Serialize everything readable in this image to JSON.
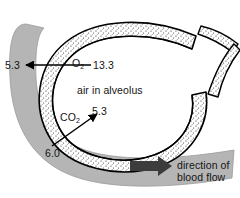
{
  "diagram": {
    "labels": {
      "oxygen": "O",
      "oxygen_sub": "2",
      "carbon_dioxide": "CO",
      "carbon_dioxide_sub": "2",
      "alveolus_space": "air in alveolus",
      "flow_line1": "direction of",
      "flow_line2": "blood flow"
    },
    "values": {
      "o2_in_air": "13.3",
      "o2_in_blood": "5.3",
      "co2_in_air": "5.3",
      "co2_in_blood": "6.0"
    },
    "colors": {
      "blood_vessel": "#b5b5b5",
      "vessel_outline": "#8a8a8a",
      "wall_stipple": "#2a2a2a",
      "wall_fill": "#ffffff",
      "outline": "#000000",
      "flow_arrow": "#3c3c3c",
      "background": "#ffffff"
    }
  }
}
